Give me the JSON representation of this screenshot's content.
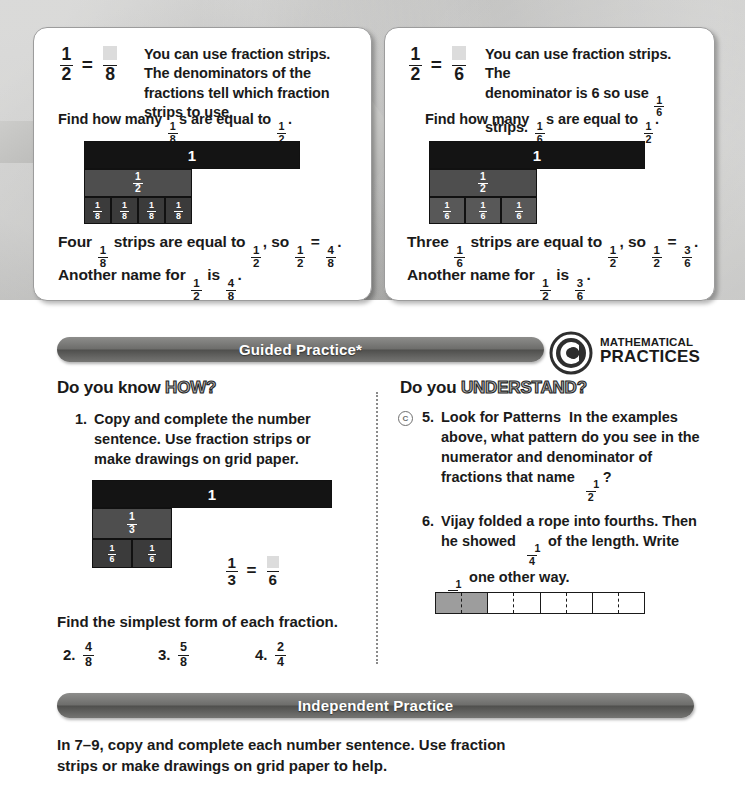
{
  "examples": [
    {
      "equation": {
        "num": "1",
        "den": "2",
        "rhs_num": "",
        "rhs_den": "8"
      },
      "note": "You can use fraction strips. The denominators of the fractions tell which fraction strips to use.",
      "find_prefix": "Find how many ",
      "find_frac": {
        "n": "1",
        "d": "8"
      },
      "find_mid": "s are equal to ",
      "find_frac2": {
        "n": "1",
        "d": "2"
      },
      "find_suffix": ".",
      "strip_one_label": "1",
      "strip_half_label": {
        "n": "1",
        "d": "2"
      },
      "unit_label": {
        "n": "1",
        "d": "8"
      },
      "unit_count": 4,
      "concl_count_word": "Four",
      "concl_1": " strips are equal to ",
      "concl_2": ", so ",
      "concl_3": " = ",
      "concl_end": ".",
      "another_prefix": "Another name for ",
      "another_mid": " is ",
      "result": {
        "n": "4",
        "d": "8"
      }
    },
    {
      "equation": {
        "num": "1",
        "den": "2",
        "rhs_num": "",
        "rhs_den": "6"
      },
      "note": "You can use fraction strips. The denominator is 6 so use  strips.",
      "note_a": "You can use fraction strips. The",
      "note_b_1": "denominator is 6 so use ",
      "note_b_frac": {
        "n": "1",
        "d": "6"
      },
      "note_b_2": " strips.",
      "find_prefix": "Find how many ",
      "find_frac": {
        "n": "1",
        "d": "6"
      },
      "find_mid": "s are equal to ",
      "find_frac2": {
        "n": "1",
        "d": "2"
      },
      "find_suffix": ".",
      "strip_one_label": "1",
      "strip_half_label": {
        "n": "1",
        "d": "2"
      },
      "unit_label": {
        "n": "1",
        "d": "6"
      },
      "unit_count": 3,
      "concl_count_word": "Three",
      "concl_1": " strips are equal to ",
      "concl_2": ", so ",
      "concl_3": " = ",
      "concl_end": ".",
      "another_prefix": "Another name for ",
      "another_mid": " is ",
      "result": {
        "n": "3",
        "d": "6"
      }
    }
  ],
  "banners": {
    "guided": "Guided Practice*",
    "independent": "Independent Practice"
  },
  "mathematical_practices": {
    "line1": "MATHEMATICAL",
    "line2": "PRACTICES",
    "logo_letter": "C"
  },
  "columns": {
    "left_heading_plain": "Do you know ",
    "left_heading_accent": "HOW?",
    "right_heading_plain": "Do you ",
    "right_heading_accent": "UNDERSTAND?"
  },
  "questions": {
    "q1": {
      "number": "1.",
      "text": "Copy and complete the number sentence. Use fraction strips or make drawings on grid paper."
    },
    "q1_diagram": {
      "one_label": "1",
      "third_label": {
        "n": "1",
        "d": "3"
      },
      "sixth_label": {
        "n": "1",
        "d": "6"
      },
      "sixth_count": 2,
      "equation": {
        "num": "1",
        "den": "3",
        "rhs_num": "",
        "rhs_den": "6"
      }
    },
    "simplest_prompt": "Find the simplest form of each fraction.",
    "simple_items": [
      {
        "number": "2.",
        "n": "4",
        "d": "8"
      },
      {
        "number": "3.",
        "n": "5",
        "d": "8"
      },
      {
        "number": "4.",
        "n": "2",
        "d": "4"
      }
    ],
    "q5": {
      "number": "5.",
      "bold_lead": "Look for Patterns",
      "text_a": "In the examples above, what pattern do you see in the numerator and denominator of fractions that name ",
      "frac": {
        "n": "1",
        "d": "2"
      },
      "text_b": "?"
    },
    "q6": {
      "number": "6.",
      "text_a": "Vijay folded a rope into fourths. Then he showed ",
      "frac1": {
        "n": "1",
        "d": "4"
      },
      "text_b": " of the length. Write ",
      "frac2": {
        "n": "1",
        "d": "4"
      },
      "text_c": " one other way."
    }
  },
  "independent_intro": {
    "lead": "In ",
    "range": "7–9",
    "rest": ", copy and complete each number sentence. Use fraction strips or make drawings on grid paper to help."
  },
  "colors": {
    "strip_one": "#141414",
    "strip_half": "#4e4e4e",
    "strip_unit": "#3b3b3b",
    "banner": "#6d6d6b",
    "page_bg": "#b9b9b7"
  }
}
